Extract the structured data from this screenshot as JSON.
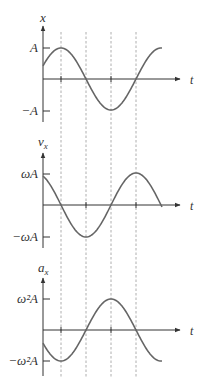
{
  "colors": {
    "axis": "#333333",
    "curve": "#666666",
    "dashed": "#999999",
    "text": "#333333"
  },
  "graphs": [
    {
      "name": "position",
      "y_label": "x",
      "y_subscript": "",
      "x_label": "t",
      "pos_tick_label": "A",
      "neg_tick_label": "−A",
      "function": "sin",
      "description": "position x(t) = A cos(wt - phi), starts above zero, peaks at first dashed line"
    },
    {
      "name": "velocity",
      "y_label": "v",
      "y_subscript": "x",
      "x_label": "t",
      "pos_tick_label": "ωA",
      "neg_tick_label": "−ωA",
      "function": "cos",
      "description": "velocity v_x(t), starts positive, zero at first dashed line, min at second"
    },
    {
      "name": "acceleration",
      "y_label": "a",
      "y_subscript": "x",
      "x_label": "t",
      "pos_tick_label": "ω²A",
      "neg_tick_label": "−ω²A",
      "function": "-sin",
      "description": "acceleration a_x(t), starts negative, min at first dashed line, max at third"
    }
  ],
  "dashed_lines_count": 4
}
